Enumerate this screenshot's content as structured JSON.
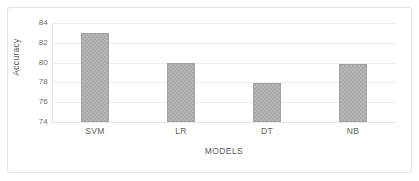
{
  "chart_data": {
    "type": "bar",
    "title": "",
    "categories": [
      "SVM",
      "LR",
      "DT",
      "NB"
    ],
    "values": [
      83.0,
      80.0,
      77.9,
      79.9
    ],
    "xlabel": "MODELS",
    "ylabel": "Accuracy",
    "ylim": [
      74,
      84
    ],
    "yticks": [
      74,
      76,
      78,
      80,
      82,
      84
    ],
    "ytick_labels": [
      "74",
      "76",
      "78",
      "80",
      "82",
      "84"
    ],
    "grid": "horizontal",
    "legend": "none",
    "series": [
      {
        "name": "Accuracy",
        "values": [
          83.0,
          80.0,
          77.9,
          79.9
        ]
      }
    ],
    "colors": {
      "bar_fill": "#a9a9a9",
      "bar_stroke": "#a0a0a0",
      "gridline": "#ededed",
      "axis_text": "#5b5b5b",
      "tick_text": "#6e6e6e",
      "frame_border": "#e3e3e3",
      "background": "#ffffff"
    }
  }
}
